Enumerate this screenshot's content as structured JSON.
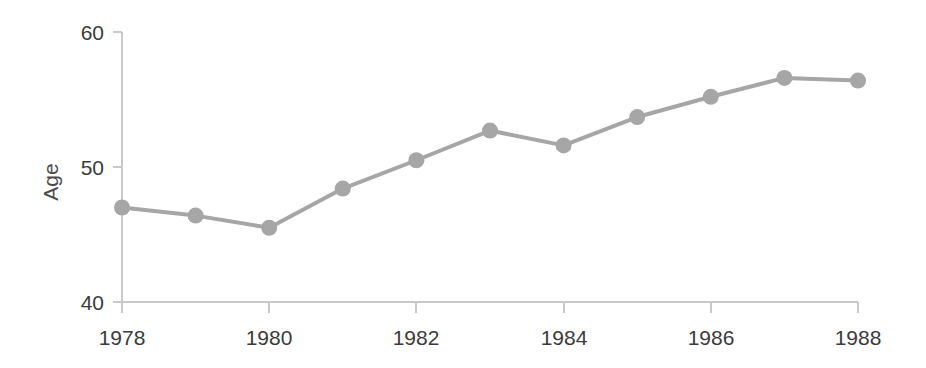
{
  "chart_data": {
    "type": "line",
    "title": "",
    "subtitle": "",
    "xlabel": "",
    "ylabel": "Age",
    "x": [
      1978,
      1979,
      1980,
      1981,
      1982,
      1983,
      1984,
      1985,
      1986,
      1987,
      1988
    ],
    "categories": [
      "1978",
      "1979",
      "1980",
      "1981",
      "1982",
      "1983",
      "1984",
      "1985",
      "1986",
      "1987",
      "1988"
    ],
    "values": [
      47.0,
      46.4,
      45.5,
      48.4,
      50.5,
      52.7,
      51.6,
      53.7,
      55.2,
      56.6,
      56.4
    ],
    "series": [
      {
        "name": "Age",
        "values": [
          47.0,
          46.4,
          45.5,
          48.4,
          50.5,
          52.7,
          51.6,
          53.7,
          55.2,
          56.6,
          56.4
        ]
      }
    ],
    "xlim": [
      1978,
      1988
    ],
    "ylim": [
      40,
      60
    ],
    "y_ticks": [
      40,
      50,
      60
    ],
    "y_tick_labels": [
      "40",
      "50",
      "60"
    ],
    "x_ticks": [
      1978,
      1980,
      1982,
      1984,
      1986,
      1988
    ],
    "x_tick_labels": [
      "1978",
      "1980",
      "1982",
      "1984",
      "1986",
      "1988"
    ],
    "grid": false,
    "legend": false,
    "legend_position": "none",
    "marker": "circle",
    "line_color": "#a6a6a6",
    "marker_color": "#a6a6a6",
    "axis_color": "#c9c9c9",
    "text_color": "#3b3b3b"
  },
  "axes": {
    "y_title": "Age",
    "y_tick_40": "40",
    "y_tick_50": "50",
    "y_tick_60": "60",
    "x_tick_1978": "1978",
    "x_tick_1980": "1980",
    "x_tick_1982": "1982",
    "x_tick_1984": "1984",
    "x_tick_1986": "1986",
    "x_tick_1988": "1988"
  }
}
